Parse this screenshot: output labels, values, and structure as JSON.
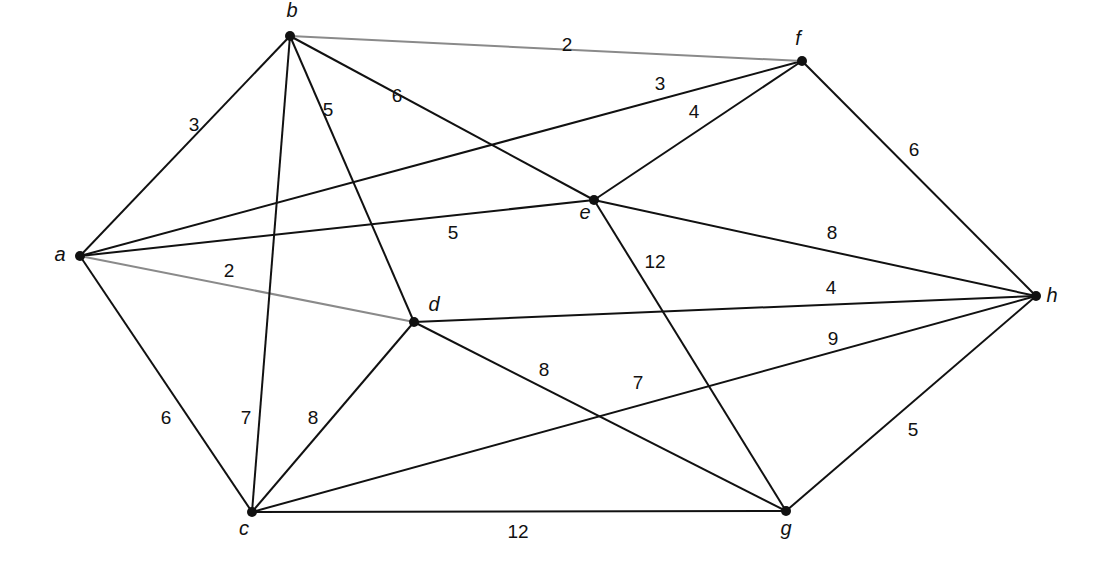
{
  "diagram": {
    "type": "weighted-undirected-graph",
    "nodes": [
      {
        "id": "a",
        "label": "a",
        "x": 80,
        "y": 256,
        "lx": 60,
        "ly": 256
      },
      {
        "id": "b",
        "label": "b",
        "x": 290,
        "y": 36,
        "lx": 292,
        "ly": 12
      },
      {
        "id": "c",
        "label": "c",
        "x": 252,
        "y": 512,
        "lx": 244,
        "ly": 530
      },
      {
        "id": "d",
        "label": "d",
        "x": 414,
        "y": 322,
        "lx": 434,
        "ly": 306
      },
      {
        "id": "e",
        "label": "e",
        "x": 594,
        "y": 200,
        "lx": 585,
        "ly": 214
      },
      {
        "id": "f",
        "label": "f",
        "x": 802,
        "y": 61,
        "lx": 798,
        "ly": 40
      },
      {
        "id": "g",
        "label": "g",
        "x": 786,
        "y": 511,
        "lx": 786,
        "ly": 530
      },
      {
        "id": "h",
        "label": "h",
        "x": 1036,
        "y": 296,
        "lx": 1052,
        "ly": 297
      }
    ],
    "edges": [
      {
        "from": "a",
        "to": "b",
        "weight": "3",
        "lx": 194,
        "ly": 126,
        "style": "dark"
      },
      {
        "from": "a",
        "to": "f",
        "weight": "3",
        "lx": 660,
        "ly": 85,
        "style": "dark"
      },
      {
        "from": "a",
        "to": "e",
        "weight": "5",
        "lx": 453,
        "ly": 234,
        "style": "dark"
      },
      {
        "from": "a",
        "to": "d",
        "weight": "2",
        "lx": 229,
        "ly": 272,
        "style": "light"
      },
      {
        "from": "a",
        "to": "c",
        "weight": "6",
        "lx": 166,
        "ly": 419,
        "style": "dark"
      },
      {
        "from": "b",
        "to": "f",
        "weight": "2",
        "lx": 567,
        "ly": 46,
        "style": "light"
      },
      {
        "from": "b",
        "to": "e",
        "weight": "6",
        "lx": 397,
        "ly": 97,
        "style": "dark"
      },
      {
        "from": "b",
        "to": "d",
        "weight": "5",
        "lx": 328,
        "ly": 111,
        "style": "dark"
      },
      {
        "from": "b",
        "to": "c",
        "weight": "7",
        "lx": 246,
        "ly": 419,
        "style": "dark"
      },
      {
        "from": "e",
        "to": "f",
        "weight": "4",
        "lx": 694,
        "ly": 113,
        "style": "dark"
      },
      {
        "from": "f",
        "to": "h",
        "weight": "6",
        "lx": 914,
        "ly": 151,
        "style": "dark"
      },
      {
        "from": "e",
        "to": "h",
        "weight": "8",
        "lx": 832,
        "ly": 234,
        "style": "dark"
      },
      {
        "from": "e",
        "to": "g",
        "weight": "12",
        "lx": 655,
        "ly": 263,
        "style": "dark"
      },
      {
        "from": "d",
        "to": "h",
        "weight": "4",
        "lx": 831,
        "ly": 289,
        "style": "dark"
      },
      {
        "from": "d",
        "to": "g",
        "weight": "8",
        "lx": 544,
        "ly": 371,
        "style": "dark"
      },
      {
        "from": "c",
        "to": "d",
        "weight": "8",
        "lx": 313,
        "ly": 419,
        "style": "dark"
      },
      {
        "from": "c",
        "to": "h",
        "weight": "9",
        "lx": 833,
        "ly": 340,
        "style": "dark"
      },
      {
        "from": "c",
        "to": "g",
        "weight": "12",
        "lx": 518,
        "ly": 533,
        "style": "dark"
      },
      {
        "from": "g",
        "to": "h",
        "weight": "5",
        "lx": 913,
        "ly": 431,
        "style": "dark"
      }
    ],
    "extra_labels": [
      {
        "text": "7",
        "x": 638,
        "y": 384
      }
    ]
  }
}
